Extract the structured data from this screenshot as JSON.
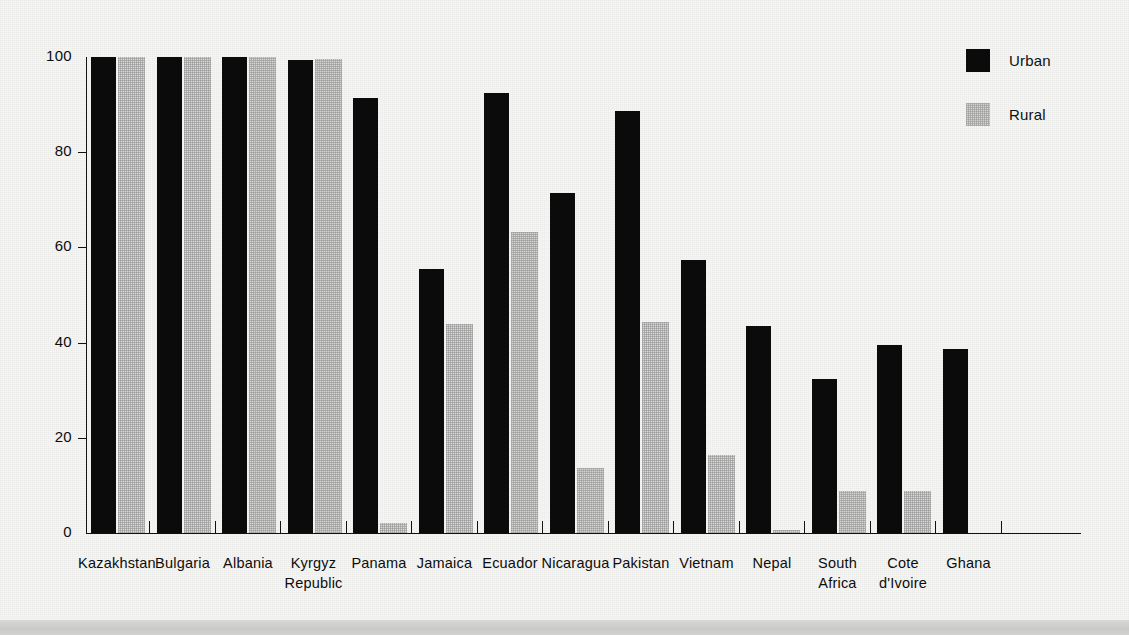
{
  "legend": {
    "position": "top-right",
    "entries": [
      {
        "label": "Urban",
        "color": "#0b0b0b",
        "key": "urban"
      },
      {
        "label": "Rural",
        "color": "#d9d9d7",
        "key": "rural"
      }
    ]
  },
  "axis": {
    "y_ticks": [
      "0",
      "20",
      "40",
      "60",
      "80",
      "100"
    ],
    "y_min": 0,
    "y_max": 100
  },
  "chart_data": {
    "type": "bar",
    "title": "",
    "subtitle": "",
    "xlabel": "",
    "ylabel": "",
    "ylim": [
      0,
      100
    ],
    "grid": false,
    "legend_position": "top-right",
    "categories": [
      "Kazakhstan",
      "Bulgaria",
      "Albania",
      "Kyrgyz\nRepublic",
      "Panama",
      "Jamaica",
      "Ecuador",
      "Nicaragua",
      "Pakistan",
      "Vietnam",
      "Nepal",
      "South\nAfrica",
      "Cote\nd'Ivoire",
      "Ghana"
    ],
    "series": [
      {
        "name": "Urban",
        "color": "#0b0b0b",
        "values": [
          100,
          100,
          100,
          99.3,
          91.3,
          55.4,
          92.5,
          71.5,
          88.6,
          57.4,
          43.5,
          32.4,
          39.6,
          38.7
        ]
      },
      {
        "name": "Rural",
        "color": "#d9d9d7",
        "values": [
          100,
          100,
          100,
          99.5,
          2.1,
          44.0,
          63.2,
          13.7,
          44.4,
          16.4,
          0.6,
          8.9,
          8.8,
          0
        ]
      }
    ]
  }
}
